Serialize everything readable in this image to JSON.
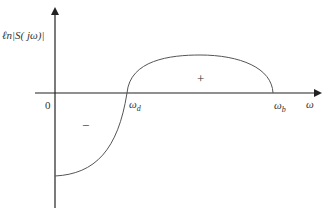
{
  "diagram": {
    "type": "sensitivity-function-plot",
    "y_axis_label": "ℓn|S( jω)|",
    "x_axis_label": "ω",
    "origin_label": "0",
    "omega_d": {
      "symbol": "ω",
      "subscript": "d"
    },
    "omega_b": {
      "symbol": "ω",
      "subscript": "b"
    },
    "positive_region_label": "+",
    "negative_region_label": "−",
    "colors": {
      "axis": "#222222",
      "curve": "#555555",
      "text": "#333333"
    }
  }
}
